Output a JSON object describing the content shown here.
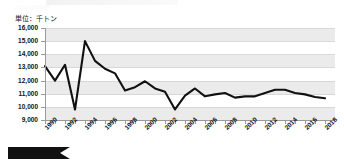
{
  "chart_data": {
    "type": "line",
    "title": "",
    "unit_label": "単位：千トン",
    "xlabel": "",
    "ylabel": "",
    "ylim": [
      9000,
      16000
    ],
    "ytick_step": 1000,
    "yticks": [
      "16,000",
      "15,000",
      "14,000",
      "13,000",
      "12,000",
      "11,000",
      "10,000",
      "9,000"
    ],
    "ytick_values": [
      16000,
      15000,
      14000,
      13000,
      12000,
      11000,
      10000,
      9000
    ],
    "xlim": [
      1990,
      2019
    ],
    "xticks": [
      "1990",
      "1992",
      "1994",
      "1996",
      "1998",
      "2000",
      "2002",
      "2004",
      "2006",
      "2008",
      "2010",
      "2012",
      "2014",
      "2016",
      "2018"
    ],
    "xtick_values": [
      1990,
      1992,
      1994,
      1996,
      1998,
      2000,
      2002,
      2004,
      2006,
      2008,
      2010,
      2012,
      2014,
      2016,
      2018
    ],
    "grid": true,
    "banded_background": true,
    "legend": null,
    "series": [
      {
        "name": "数量",
        "color": "#111111",
        "x": [
          1990,
          1991,
          1992,
          1993,
          1994,
          1995,
          1996,
          1997,
          1998,
          1999,
          2000,
          2001,
          2002,
          2003,
          2004,
          2005,
          2006,
          2007,
          2008,
          2009,
          2010,
          2011,
          2012,
          2013,
          2014,
          2015,
          2016,
          2017,
          2018
        ],
        "values": [
          13100,
          12000,
          13200,
          9800,
          15000,
          13500,
          12900,
          12550,
          11250,
          11500,
          11950,
          11400,
          11150,
          9800,
          10850,
          11400,
          10800,
          10950,
          11050,
          10700,
          10800,
          10800,
          11050,
          11300,
          11300,
          11050,
          10950,
          10750,
          10650
        ]
      }
    ]
  },
  "banner": {
    "label": "POINT"
  }
}
